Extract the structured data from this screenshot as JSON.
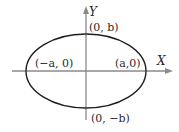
{
  "diagram": {
    "type": "ellipse-on-axes",
    "colors": {
      "axis": "#8a8a8a",
      "curve": "#1e1e1e",
      "text": "#2a2a2a"
    },
    "axes": {
      "x_label": "X",
      "y_label": "Y"
    },
    "points": {
      "top": "(0, b)",
      "bottom": "(0, −b)",
      "left": "(−a, 0)",
      "right": "(a,0)"
    }
  }
}
